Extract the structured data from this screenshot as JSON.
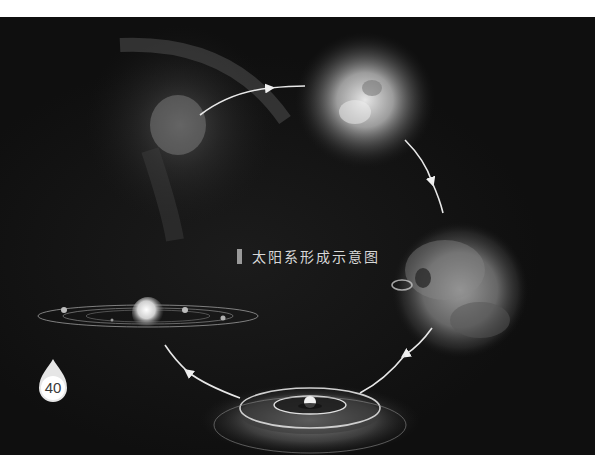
{
  "page": {
    "top_text_partial": "",
    "background_color": "#0f0f0f",
    "page_number": "40"
  },
  "figure": {
    "caption": "太阳系形成示意图",
    "stages": [
      {
        "id": "nebula",
        "label": ""
      },
      {
        "id": "collapsing-cloud",
        "label": ""
      },
      {
        "id": "protostar-cloud",
        "label": ""
      },
      {
        "id": "protoplanetary-disk",
        "label": ""
      },
      {
        "id": "solar-system",
        "label": ""
      }
    ],
    "arrow_color": "#e8e8e8"
  }
}
